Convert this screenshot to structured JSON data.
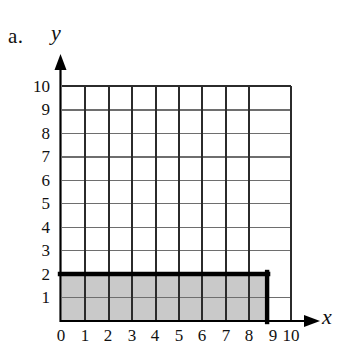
{
  "figure": {
    "part_label": "a.",
    "x_axis_name": "x",
    "y_axis_name": "y",
    "x_tick_labels": [
      "0",
      "1",
      "2",
      "3",
      "4",
      "5",
      "6",
      "7",
      "8",
      "9",
      "10"
    ],
    "y_tick_labels": [
      "1",
      "2",
      "3",
      "4",
      "5",
      "6",
      "7",
      "8",
      "9",
      "10"
    ],
    "colors": {
      "shaded_region_fill": "#c9c9c9",
      "outline": "#000000",
      "grid_vertical": "#2b2b2b",
      "grid_horizontal": "#6e6e6e",
      "axis": "#000000",
      "background": "#ffffff"
    }
  },
  "chart_data": {
    "type": "area",
    "title": "",
    "xlabel": "x",
    "ylabel": "y",
    "xlim": [
      0,
      10
    ],
    "ylim": [
      0,
      10
    ],
    "xticks": [
      0,
      1,
      2,
      3,
      4,
      5,
      6,
      7,
      8,
      9,
      10
    ],
    "yticks": [
      0,
      1,
      2,
      3,
      4,
      5,
      6,
      7,
      8,
      9,
      10
    ],
    "grid": true,
    "grid_spacing": 1,
    "legend": "none",
    "annotations": [
      "a."
    ],
    "shaded_region": {
      "shape": "rectangle",
      "x_start": 0,
      "x_end": 9,
      "y_start": 0,
      "y_end": 2,
      "width": 9,
      "height": 2,
      "area": 18,
      "fill": "#c9c9c9",
      "outlined": true,
      "outline_color": "#000000"
    }
  }
}
